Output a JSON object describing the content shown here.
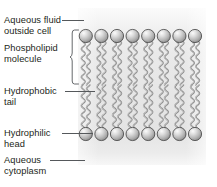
{
  "diagram": {
    "labels": [
      {
        "id": "aqueous-fluid-outside-cell",
        "text": "Aqueous fluid\noutside cell",
        "x": 4,
        "y": 15,
        "leader": {
          "x": 62,
          "y": 20,
          "width": 22
        }
      },
      {
        "id": "phospholipid-molecule",
        "text": "Phospholipid\nmolecule",
        "x": 4,
        "y": 43,
        "leader": null
      },
      {
        "id": "hydrophobic-tail",
        "text": "Hydrophobic\ntail",
        "x": 4,
        "y": 86,
        "leader": {
          "x": 65,
          "y": 91,
          "width": 30
        }
      },
      {
        "id": "hydrophilic-head",
        "text": "Hydrophilic\nhead",
        "x": 4,
        "y": 128,
        "leader": {
          "x": 62,
          "y": 133,
          "width": 31
        }
      },
      {
        "id": "aqueous-cytoplasm",
        "text": "Aqueous\ncytoplasm",
        "x": 4,
        "y": 155,
        "leader": {
          "x": 50,
          "y": 160,
          "width": 35
        }
      }
    ],
    "bracket": {
      "id": "phospholipid-molecule-bracket",
      "x": 71,
      "y": 30,
      "height": 54,
      "tip_y": 57
    },
    "membrane": {
      "x": 78,
      "y": 8,
      "width": 128,
      "height": 157,
      "lipid_count": 8,
      "spacing": 15.6,
      "first_center_x": 85.8,
      "head_radius": 6.6,
      "top_head_cy": 36,
      "bottom_head_cy": 134,
      "tail_top_start_y": 42,
      "tail_midline_y": 85,
      "tail_bottom_end_y": 128,
      "head_color_light": "#f2f2f2",
      "head_color_mid": "#c9c9c9",
      "head_color_dark": "#8f8f8f",
      "head_stroke": "#4a4a4a",
      "tail_color": "#8d8d8d",
      "tail_highlight": "#e8e8e8",
      "background_color": "#e6e6e6"
    },
    "text_color": "#231f20",
    "leader_color": "#55585b"
  }
}
